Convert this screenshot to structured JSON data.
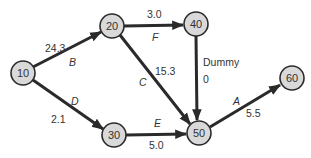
{
  "diagram": {
    "type": "activity-on-arrow network",
    "nodes": [
      {
        "id": "10",
        "label": "10",
        "x": 23,
        "y": 73
      },
      {
        "id": "20",
        "label": "20",
        "x": 112,
        "y": 26
      },
      {
        "id": "40",
        "label": "40",
        "x": 196,
        "y": 24
      },
      {
        "id": "30",
        "label": "30",
        "x": 114,
        "y": 135
      },
      {
        "id": "50",
        "label": "50",
        "x": 199,
        "y": 133
      },
      {
        "id": "60",
        "label": "60",
        "x": 292,
        "y": 78
      }
    ],
    "edges": [
      {
        "from": "10",
        "to": "20",
        "activity": "B",
        "duration": "24.3"
      },
      {
        "from": "10",
        "to": "30",
        "activity": "D",
        "duration": "2.1"
      },
      {
        "from": "20",
        "to": "40",
        "activity": "F",
        "duration": "3.0"
      },
      {
        "from": "20",
        "to": "50",
        "activity": "C",
        "duration": "15.3"
      },
      {
        "from": "40",
        "to": "50",
        "activity": "Dummy",
        "duration": "0"
      },
      {
        "from": "30",
        "to": "50",
        "activity": "E",
        "duration": "5.0"
      },
      {
        "from": "50",
        "to": "60",
        "activity": "A",
        "duration": "5.5"
      }
    ]
  },
  "labels": {
    "n10": "10",
    "n20": "20",
    "n40": "40",
    "n30": "30",
    "n50": "50",
    "n60": "60",
    "B": "B",
    "B_dur": "24.3",
    "D": "D",
    "D_dur": "2.1",
    "F": "F",
    "F_dur": "3.0",
    "C": "C",
    "C_dur": "15.3",
    "dummy": "Dummy",
    "dummy_dur": "0",
    "E": "E",
    "E_dur": "5.0",
    "A": "A",
    "A_dur": "5.5"
  }
}
